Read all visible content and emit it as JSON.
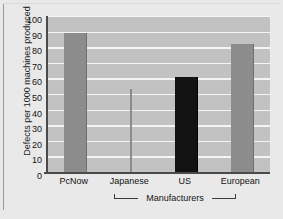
{
  "chart_data": {
    "type": "bar",
    "title": "",
    "subtitle": "",
    "categories": [
      "PcNow",
      "Japanese",
      "US",
      "European"
    ],
    "values": [
      89,
      53,
      61,
      82
    ],
    "xlabel": "Manufacturers",
    "ylabel": "Defects per 1000 machines produced",
    "ylim": [
      0,
      100
    ],
    "ytick_labels": [
      "100",
      "90",
      "80",
      "70",
      "60",
      "50",
      "40",
      "30",
      "20",
      "10",
      "0"
    ],
    "ytick_values": [
      100,
      90,
      80,
      70,
      60,
      50,
      40,
      30,
      20,
      10,
      0
    ],
    "ytick_step": 10,
    "grid": "horizontal",
    "legend": "none",
    "bar_colors": [
      "#8c8c8c",
      "#8c8c8c",
      "#121212",
      "#8c8c8c"
    ],
    "bar_widths": [
      "normal",
      "hairline",
      "normal",
      "normal"
    ],
    "plot_background": "#c2c2c2",
    "gridline_color": "#f4f4f4",
    "axis_color": "#4a4a4a",
    "figure_background": "#e9e9e9",
    "annotations": [
      {
        "name": "x-axis-bracket",
        "text": "Manufacturers",
        "spans": [
          "Japanese",
          "European"
        ]
      }
    ]
  }
}
